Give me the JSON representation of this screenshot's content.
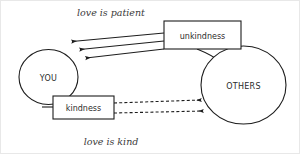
{
  "diagram": {
    "type": "relationship-flow-diagram",
    "captions": {
      "top": "love is patient",
      "bottom": "love is kind"
    },
    "nodes": [
      {
        "id": "you",
        "label": "YOU",
        "shape": "circle"
      },
      {
        "id": "others",
        "label": "OTHERS",
        "shape": "circle"
      },
      {
        "id": "unkindness",
        "label": "unkindness",
        "shape": "rectangle"
      },
      {
        "id": "kindness",
        "label": "kindness",
        "shape": "rectangle"
      }
    ],
    "edges": [
      {
        "from": "unkindness",
        "to": "you",
        "style": "solid",
        "arrow": "to",
        "count": 3
      },
      {
        "from": "kindness",
        "to": "others",
        "style": "dashed",
        "arrow": "to",
        "count": 2
      },
      {
        "from": "unkindness",
        "to": "others",
        "style": "solid",
        "arrow": "none"
      },
      {
        "from": "kindness",
        "to": "you",
        "style": "solid",
        "arrow": "none"
      }
    ],
    "colors": {
      "stroke": "#1d1d1d",
      "text": "#2b2b2b",
      "caption": "#3a3a3a",
      "background": "#ffffff",
      "border": "#e8e8e8"
    }
  }
}
